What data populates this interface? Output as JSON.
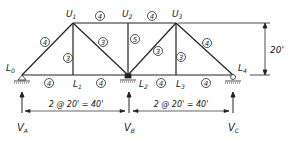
{
  "diagram": {
    "type": "continuous truss with three supports",
    "nodes": {
      "L0": {
        "label": "L",
        "sub": "0",
        "x": 22,
        "y": 75
      },
      "L1": {
        "label": "L",
        "sub": "1",
        "x": 73,
        "y": 75
      },
      "L2": {
        "label": "L",
        "sub": "2",
        "x": 128,
        "y": 75
      },
      "L3": {
        "label": "L",
        "sub": "3",
        "x": 176,
        "y": 75
      },
      "L4": {
        "label": "L",
        "sub": "4",
        "x": 233,
        "y": 75
      },
      "U1": {
        "label": "U",
        "sub": "1",
        "x": 73,
        "y": 23
      },
      "U2": {
        "label": "U",
        "sub": "2",
        "x": 128,
        "y": 23
      },
      "U3": {
        "label": "U",
        "sub": "3",
        "x": 176,
        "y": 23
      }
    },
    "members": [
      {
        "from": "L0",
        "to": "U1",
        "area": "4"
      },
      {
        "from": "U1",
        "to": "U2",
        "area": "4"
      },
      {
        "from": "U2",
        "to": "U3",
        "area": "4"
      },
      {
        "from": "U3",
        "to": "L4",
        "area": "4"
      },
      {
        "from": "L0",
        "to": "L1",
        "area": "4"
      },
      {
        "from": "L1",
        "to": "L2",
        "area": "4"
      },
      {
        "from": "L2",
        "to": "L3",
        "area": "4"
      },
      {
        "from": "L3",
        "to": "L4",
        "area": "4"
      },
      {
        "from": "U1",
        "to": "L1",
        "area": "3"
      },
      {
        "from": "U1",
        "to": "L2",
        "area": "3"
      },
      {
        "from": "U2",
        "to": "L2",
        "area": "5"
      },
      {
        "from": "L2",
        "to": "U3",
        "area": "3"
      },
      {
        "from": "U3",
        "to": "L3",
        "area": "3"
      }
    ],
    "labels": {
      "L0": "L",
      "L0_sub": "0",
      "L1": "L",
      "L1_sub": "1",
      "L2": "L",
      "L2_sub": "2",
      "L3": "L",
      "L3_sub": "3",
      "L4": "L",
      "L4_sub": "4",
      "U1": "U",
      "U1_sub": "1",
      "U2": "U",
      "U2_sub": "2",
      "U3": "U",
      "U3_sub": "3"
    },
    "member_areas": {
      "L0U1": "4",
      "U1U2": "4",
      "U2U3": "4",
      "U3L4": "4",
      "L0L1": "4",
      "L1L2": "4",
      "L2L3": "4",
      "L3L4": "4",
      "U1L1": "3",
      "U1L2": "3",
      "U2L2": "5",
      "L2U3": "3",
      "U3L3": "3"
    },
    "height_dimension": "20'",
    "span_dimensions": [
      "2 @ 20' = 40'",
      "2 @ 20' = 40'"
    ],
    "reactions": {
      "A": {
        "label": "V",
        "sub": "A"
      },
      "B": {
        "label": "V",
        "sub": "B"
      },
      "C": {
        "label": "V",
        "sub": "C"
      }
    }
  }
}
